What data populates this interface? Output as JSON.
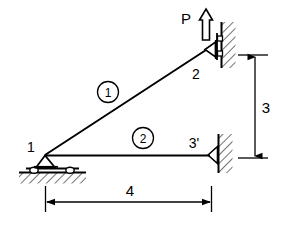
{
  "figure": {
    "type": "structural-truss-free-body-diagram",
    "background_color": "#ffffff",
    "line_color": "#000000"
  },
  "load": {
    "label": "P",
    "direction": "up",
    "arrow_style": "hollow-outline",
    "applied_at_node": "2"
  },
  "nodes": [
    {
      "id": "n1",
      "label": "1",
      "x": 45,
      "y": 155,
      "support": "roller-on-ground",
      "support_icon": "roller-support-icon"
    },
    {
      "id": "n2",
      "label": "2",
      "x": 205,
      "y": 50,
      "support": "roller-on-vertical-wall",
      "support_icon": "wall-roller-support-icon"
    },
    {
      "id": "n3",
      "label": "3'",
      "x": 208,
      "y": 155,
      "support": "pin-on-vertical-wall",
      "support_icon": "pin-support-icon"
    }
  ],
  "members": [
    {
      "id": "m1",
      "label": "1",
      "from": "n1",
      "to": "n2",
      "label_x": 108,
      "label_y": 93
    },
    {
      "id": "m2",
      "label": "2",
      "from": "n1",
      "to": "n3",
      "label_x": 143,
      "label_y": 139
    }
  ],
  "dimensions": [
    {
      "id": "dim-vertical",
      "label": "3",
      "orientation": "vertical",
      "label_x": 264,
      "label_y": 112
    },
    {
      "id": "dim-horizontal",
      "label": "4",
      "orientation": "horizontal",
      "label_x": 130,
      "label_y": 196
    }
  ],
  "node_labels": {
    "n1": {
      "text": "1",
      "x": 31,
      "y": 152
    },
    "n2": {
      "text": "2",
      "x": 196,
      "y": 78
    },
    "n3": {
      "text": "3'",
      "x": 192,
      "y": 148
    }
  },
  "load_label": {
    "text": "P",
    "x": 186,
    "y": 24
  }
}
